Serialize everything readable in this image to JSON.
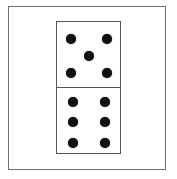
{
  "figure": {
    "domino": {
      "top_half": {
        "pips": 5,
        "pattern": "quincunx"
      },
      "bottom_half": {
        "pips": 6,
        "pattern": "two-columns-of-three"
      }
    }
  },
  "colors": {
    "frame": "#6e6e6e",
    "domino_border": "#555555",
    "pip": "#111111",
    "background": "#ffffff"
  }
}
